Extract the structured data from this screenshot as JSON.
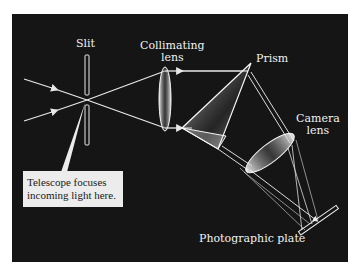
{
  "diagram": {
    "labels": {
      "slit": "Slit",
      "collimating_lens_line1": "Collimating",
      "collimating_lens_line2": "lens",
      "prism": "Prism",
      "camera_lens_line1": "Camera",
      "camera_lens_line2": "lens",
      "photographic_plate": "Photographic plate"
    },
    "callout": {
      "line1": "Telescope focuses",
      "line2": "incoming light here."
    },
    "colors": {
      "background": "#151515",
      "rays": "#e8e8e8",
      "callout_bg": "#ececec"
    }
  }
}
